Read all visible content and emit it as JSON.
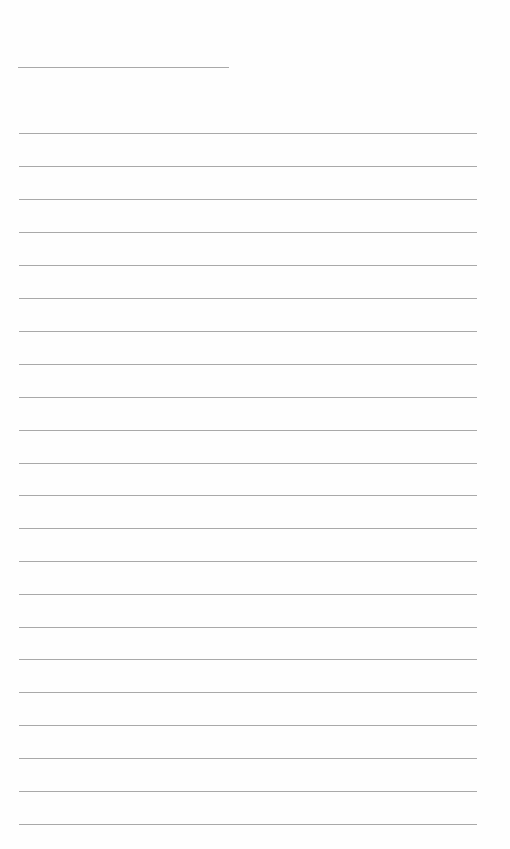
{
  "document": {
    "type": "lined-paper",
    "background_color": "#ffffff",
    "line_color": "#a9a9a9",
    "header_line": {
      "x": 18,
      "y": 67,
      "width": 211
    },
    "ruled_lines": {
      "x": 19,
      "width": 458,
      "y_positions": [
        133,
        166,
        199,
        232,
        265,
        298,
        331,
        364,
        397,
        430,
        463,
        495,
        528,
        561,
        594,
        627,
        659,
        692,
        725,
        758,
        791,
        824
      ]
    }
  }
}
